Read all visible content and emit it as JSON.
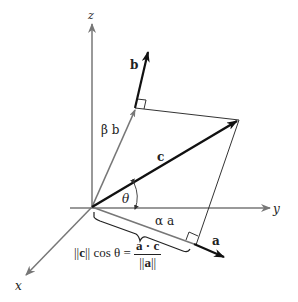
{
  "figure": {
    "colors": {
      "axis": "#777777",
      "vector_bold": "#111111",
      "component": "#777777",
      "construction": "#333333",
      "background": "#ffffff"
    },
    "axes": {
      "x_label": "x",
      "y_label": "y",
      "z_label": "z"
    },
    "vectors": {
      "a_label": "a",
      "b_label": "b",
      "c_label": "c",
      "alpha_a_label": "α a",
      "beta_b_label": "β b"
    },
    "angle": {
      "label": "θ"
    },
    "formula": {
      "lhs_norm_open": "||",
      "lhs_vec": "c",
      "lhs_norm_close": "||",
      "lhs_rest": " cos θ = ",
      "numerator": "a · c",
      "denominator_open": "||",
      "denominator_vec": "a",
      "denominator_close": "||"
    }
  }
}
